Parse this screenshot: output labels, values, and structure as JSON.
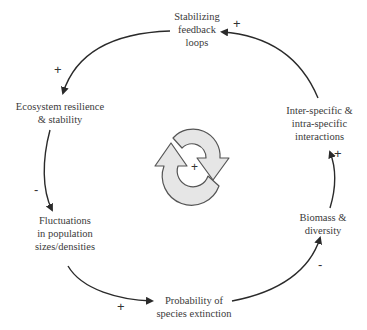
{
  "diagram": {
    "type": "causal-loop",
    "nodes": [
      {
        "id": "stabilizing",
        "lines": [
          "Stabilizing",
          "feedback",
          "loops"
        ]
      },
      {
        "id": "resilience",
        "lines": [
          "Ecosystem resilience",
          "& stability"
        ]
      },
      {
        "id": "fluctuations",
        "lines": [
          "Fluctuations",
          "in population",
          "sizes/densities"
        ]
      },
      {
        "id": "extinction",
        "lines": [
          "Probability of",
          "species extinction"
        ]
      },
      {
        "id": "biomass",
        "lines": [
          "Biomass &",
          "diversity"
        ]
      },
      {
        "id": "interactions",
        "lines": [
          "Inter-specific &",
          "intra-specific",
          "interactions"
        ]
      }
    ],
    "links": [
      {
        "from": "stabilizing",
        "to": "resilience",
        "sign": "+"
      },
      {
        "from": "resilience",
        "to": "fluctuations",
        "sign": "-"
      },
      {
        "from": "fluctuations",
        "to": "extinction",
        "sign": "+"
      },
      {
        "from": "extinction",
        "to": "biomass",
        "sign": "-"
      },
      {
        "from": "biomass",
        "to": "interactions",
        "sign": "+"
      },
      {
        "from": "interactions",
        "to": "stabilizing",
        "sign": "+"
      }
    ],
    "loop_polarity": "+",
    "colors": {
      "line": "#2a2a2a",
      "loop_icon_fill": "#e6e6e6",
      "loop_icon_stroke": "#555555"
    }
  }
}
